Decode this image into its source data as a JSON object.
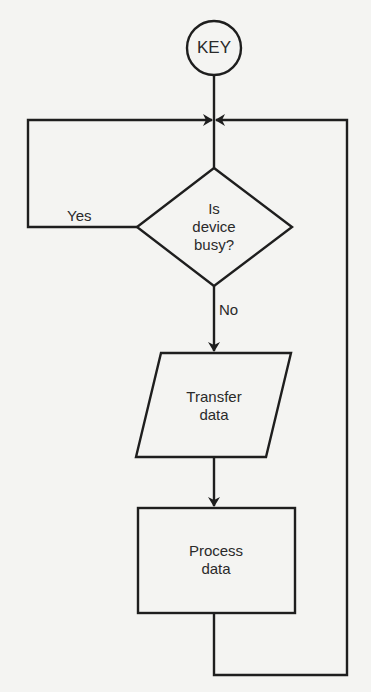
{
  "diagram": {
    "type": "flowchart",
    "nodes": [
      {
        "id": "key",
        "shape": "circle",
        "label": "KEY"
      },
      {
        "id": "decision",
        "shape": "diamond",
        "lines": [
          "Is",
          "device",
          "busy?"
        ]
      },
      {
        "id": "transfer",
        "shape": "parallelogram",
        "lines": [
          "Transfer",
          "data"
        ]
      },
      {
        "id": "process",
        "shape": "rectangle",
        "lines": [
          "Process",
          "data"
        ]
      }
    ],
    "edges": [
      {
        "from": "key",
        "to": "decision",
        "label": ""
      },
      {
        "from": "decision",
        "to": "decision",
        "label": "Yes"
      },
      {
        "from": "decision",
        "to": "transfer",
        "label": "No"
      },
      {
        "from": "transfer",
        "to": "process",
        "label": ""
      },
      {
        "from": "process",
        "to": "decision",
        "label": ""
      }
    ],
    "labels": {
      "key": "KEY",
      "decision_l1": "Is",
      "decision_l2": "device",
      "decision_l3": "busy?",
      "transfer_l1": "Transfer",
      "transfer_l2": "data",
      "process_l1": "Process",
      "process_l2": "data",
      "yes": "Yes",
      "no": "No"
    },
    "colors": {
      "stroke": "#1e1e1e",
      "background": "#f4f4f2",
      "text": "#2a2a2a"
    }
  }
}
